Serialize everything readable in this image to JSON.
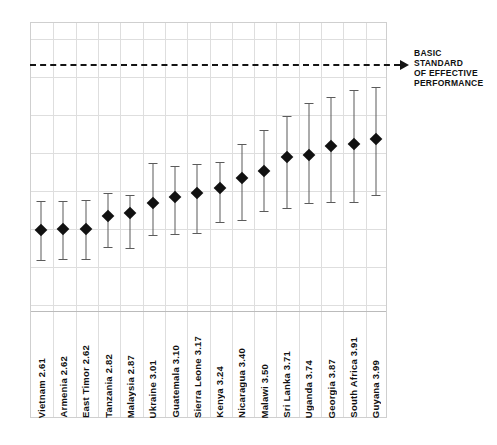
{
  "chart_data": {
    "type": "scatter",
    "title": "",
    "subtitle": "",
    "xlabel": "",
    "ylabel": "",
    "grid": true,
    "legend": "none",
    "ylim": [
      1.4,
      5.75
    ],
    "annotations": [
      {
        "name": "basic-standard-line",
        "value": 5.12,
        "style": "dashed-with-arrow",
        "text": "BASIC\nSTANDARD\nOF EFFECTIVE\nPERFORMANCE"
      }
    ],
    "categories": [
      "Vietnam",
      "Armenia",
      "East Timor",
      "Tanzania",
      "Malaysia",
      "Ukraine",
      "Guatemala",
      "Sierra Leone",
      "Kenya",
      "Nicaragua",
      "Malawi",
      "Sri Lanka",
      "Uganda",
      "Georgia",
      "South Africa",
      "Guyana"
    ],
    "values": [
      2.61,
      2.62,
      2.62,
      2.82,
      2.87,
      3.01,
      3.1,
      3.17,
      3.24,
      3.4,
      3.5,
      3.71,
      3.74,
      3.87,
      3.91,
      3.99
    ],
    "ci_low": [
      2.16,
      2.17,
      2.17,
      2.35,
      2.33,
      2.54,
      2.55,
      2.57,
      2.73,
      2.76,
      2.89,
      2.94,
      3.02,
      3.03,
      3.03,
      3.14
    ],
    "ci_high": [
      3.04,
      3.05,
      3.06,
      3.16,
      3.13,
      3.62,
      3.58,
      3.6,
      3.64,
      3.91,
      4.12,
      4.33,
      4.53,
      4.62,
      4.72,
      4.77
    ],
    "points": [
      {
        "category": "Vietnam",
        "label": "Vietnam  2.61",
        "value": 2.61,
        "ci_low": 2.16,
        "ci_high": 3.04
      },
      {
        "category": "Armenia",
        "label": "Armenia  2.62",
        "value": 2.62,
        "ci_low": 2.17,
        "ci_high": 3.05
      },
      {
        "category": "East Timor",
        "label": "East Timor  2.62",
        "value": 2.62,
        "ci_low": 2.17,
        "ci_high": 3.06
      },
      {
        "category": "Tanzania",
        "label": "Tanzania  2.82",
        "value": 2.82,
        "ci_low": 2.35,
        "ci_high": 3.16
      },
      {
        "category": "Malaysia",
        "label": "Malaysia  2.87",
        "value": 2.87,
        "ci_low": 2.33,
        "ci_high": 3.13
      },
      {
        "category": "Ukraine",
        "label": "Ukraine  3.01",
        "value": 3.01,
        "ci_low": 2.54,
        "ci_high": 3.62
      },
      {
        "category": "Guatemala",
        "label": "Guatemala  3.10",
        "value": 3.1,
        "ci_low": 2.55,
        "ci_high": 3.58
      },
      {
        "category": "Sierra Leone",
        "label": "Sierra Leone  3.17",
        "value": 3.17,
        "ci_low": 2.57,
        "ci_high": 3.6
      },
      {
        "category": "Kenya",
        "label": "Kenya  3.24",
        "value": 3.24,
        "ci_low": 2.73,
        "ci_high": 3.64
      },
      {
        "category": "Nicaragua",
        "label": "Nicaragua  3.40",
        "value": 3.4,
        "ci_low": 2.76,
        "ci_high": 3.91
      },
      {
        "category": "Malawi",
        "label": "Malawi  3.50",
        "value": 3.5,
        "ci_low": 2.89,
        "ci_high": 4.12
      },
      {
        "category": "Sri Lanka",
        "label": "Sri Lanka  3.71",
        "value": 3.71,
        "ci_low": 2.94,
        "ci_high": 4.33
      },
      {
        "category": "Uganda",
        "label": "Uganda  3.74",
        "value": 3.74,
        "ci_low": 3.02,
        "ci_high": 4.53
      },
      {
        "category": "Georgia",
        "label": "Georgia  3.87",
        "value": 3.87,
        "ci_low": 3.03,
        "ci_high": 4.62
      },
      {
        "category": "South Africa",
        "label": "South Africa  3.91",
        "value": 3.91,
        "ci_low": 3.03,
        "ci_high": 4.72
      },
      {
        "category": "Guyana",
        "label": "Guyana  3.99",
        "value": 3.99,
        "ci_low": 3.14,
        "ci_high": 4.77
      }
    ]
  },
  "colors": {
    "marker": "#111111",
    "whisker": "#5b5b5b",
    "gridline": "#dedede",
    "frame": "#cfcfcf",
    "refline": "#141414",
    "background": "#ffffff"
  }
}
